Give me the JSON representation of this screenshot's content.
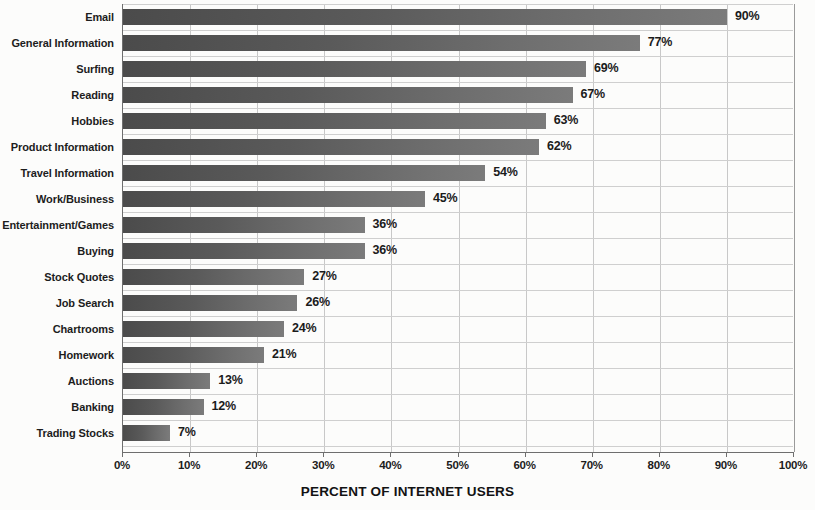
{
  "chart_data": {
    "type": "bar",
    "orientation": "horizontal",
    "title": "",
    "xlabel": "PERCENT OF INTERNET USERS",
    "ylabel": "",
    "xlim": [
      0,
      100
    ],
    "grid": true,
    "legend": null,
    "categories": [
      "Email",
      "General Information",
      "Surfing",
      "Reading",
      "Hobbies",
      "Product Information",
      "Travel Information",
      "Work/Business",
      "Entertainment/Games",
      "Buying",
      "Stock Quotes",
      "Job Search",
      "Chartrooms",
      "Homework",
      "Auctions",
      "Banking",
      "Trading Stocks"
    ],
    "values": [
      90,
      77,
      69,
      67,
      63,
      62,
      54,
      45,
      36,
      36,
      27,
      26,
      24,
      21,
      13,
      12,
      7
    ],
    "value_labels": [
      "90%",
      "77%",
      "69%",
      "67%",
      "63%",
      "62%",
      "54%",
      "45%",
      "36%",
      "36%",
      "27%",
      "26%",
      "24%",
      "21%",
      "13%",
      "12%",
      "7%"
    ],
    "xticks": [
      0,
      10,
      20,
      30,
      40,
      50,
      60,
      70,
      80,
      90,
      100
    ],
    "xtick_labels": [
      "0%",
      "10%",
      "20%",
      "30%",
      "40%",
      "50%",
      "60%",
      "70%",
      "80%",
      "90%",
      "100%"
    ],
    "colors": {
      "bar_dark": "#4b4b4b",
      "bar_light": "#7b7b7b",
      "axis": "#6e6e6e",
      "grid": "#cfcfcf",
      "text": "#1d1d1d",
      "background": "#fcfcfb"
    }
  }
}
